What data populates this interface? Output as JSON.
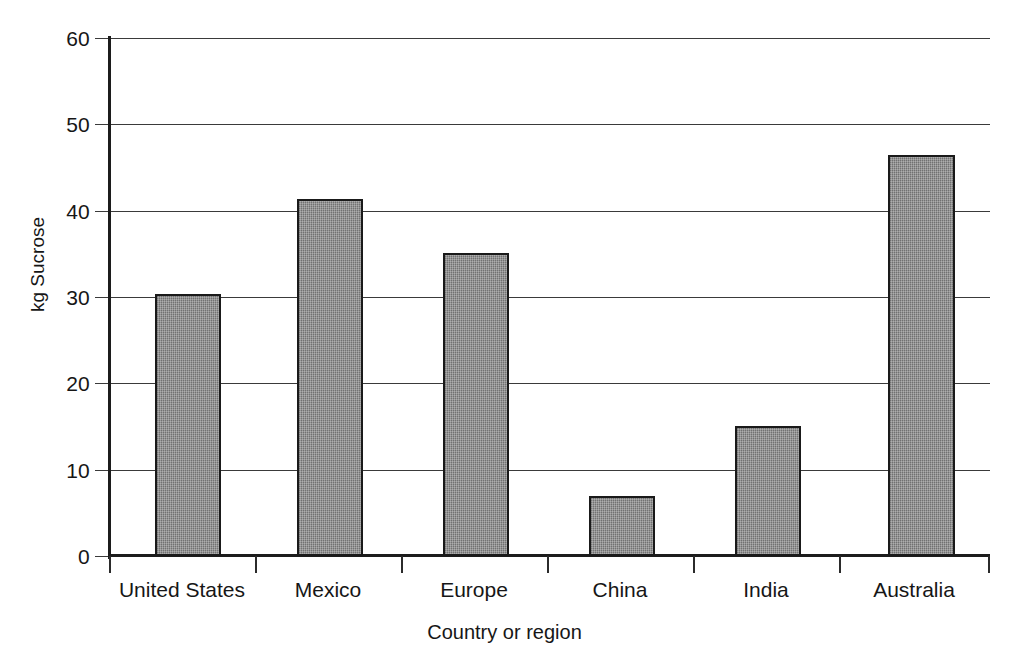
{
  "chart_data": {
    "type": "bar",
    "title": "",
    "subtitle": "",
    "xlabel": "Country or region",
    "ylabel": "kg Sucrose",
    "categories": [
      "United States",
      "Mexico",
      "Europe",
      "China",
      "India",
      "Australia"
    ],
    "values": [
      30.4,
      41.3,
      35.1,
      7.0,
      15.1,
      46.5
    ],
    "series": [
      {
        "name": "kg Sucrose",
        "values": [
          30.4,
          41.3,
          35.1,
          7.0,
          15.1,
          46.5
        ]
      }
    ],
    "ylim": [
      0,
      60
    ],
    "ytick_labels": [
      "0",
      "10",
      "20",
      "30",
      "40",
      "50",
      "60"
    ],
    "ytick_values": [
      0,
      10,
      20,
      30,
      40,
      50,
      60
    ],
    "grid": "horizontal",
    "legend": "none",
    "bar_fill_color": "#8a8a8a",
    "bar_border_color": "#1a1a1a",
    "axis_color": "#1c1c1c",
    "gridline_color": "#3a3a3a",
    "background_color": "#ffffff"
  }
}
